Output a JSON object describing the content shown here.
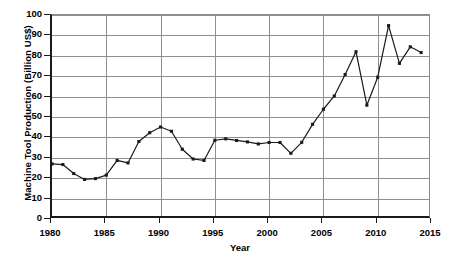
{
  "chart_data": {
    "type": "line",
    "title": "",
    "xlabel": "Year",
    "ylabel": "Machine Tool Production (Billion US$)",
    "xlim": [
      1980,
      2015
    ],
    "ylim": [
      0,
      100
    ],
    "xticks": [
      1980,
      1985,
      1990,
      1995,
      2000,
      2005,
      2010,
      2015
    ],
    "yticks": [
      0,
      10,
      20,
      30,
      40,
      50,
      60,
      70,
      80,
      90,
      100
    ],
    "grid": "horizontal-and-major-vertical",
    "legend": "none",
    "marker": "square",
    "line_color": "#1a1a1a",
    "x": [
      1980,
      1981,
      1982,
      1983,
      1984,
      1985,
      1986,
      1987,
      1988,
      1989,
      1990,
      1991,
      1992,
      1993,
      1994,
      1995,
      1996,
      1997,
      1998,
      1999,
      2000,
      2001,
      2002,
      2003,
      2004,
      2005,
      2006,
      2007,
      2008,
      2009,
      2010,
      2011,
      2012,
      2013,
      2014
    ],
    "values": [
      27,
      26.7,
      22.3,
      19.4,
      19.8,
      21.5,
      28.7,
      27.5,
      38,
      42.3,
      45.1,
      43,
      34.2,
      29.4,
      28.7,
      38.6,
      39.3,
      38.5,
      37.8,
      36.8,
      37.5,
      37.5,
      32.2,
      37.6,
      46.4,
      53.8,
      60.3,
      70.8,
      82,
      55.8,
      69.5,
      94.8,
      76.3,
      84.4,
      81.6
    ]
  },
  "axis": {
    "y_title": "Machine Tool Production (Billion US$)",
    "x_title": "Year",
    "y_labels": [
      "100",
      "90",
      "80",
      "70",
      "60",
      "50",
      "40",
      "30",
      "20",
      "10",
      "0"
    ],
    "x_labels": [
      "1980",
      "1985",
      "1990",
      "1995",
      "2000",
      "2005",
      "2010",
      "2015"
    ]
  },
  "caption": {
    "text": ""
  },
  "colors": {
    "line": "#1a1a1a",
    "grid": "#8f8f8f",
    "axis": "#1a1a1a",
    "background": "#ffffff"
  }
}
